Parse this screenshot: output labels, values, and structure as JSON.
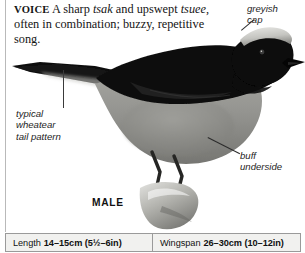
{
  "figure": {
    "species_caption": "MALE",
    "voice": {
      "label": "VOICE",
      "text_part1": " A sharp ",
      "italic1": "tsak",
      "text_part2": " and upswept ",
      "italic2": "tsuee",
      "text_part3": ", often in combination; buzzy, repetitive song."
    },
    "annotations": [
      {
        "id": "greyish-cap",
        "text": "greyish\ncap"
      },
      {
        "id": "tail-pattern",
        "text": "typical\nwheatear\ntail pattern"
      },
      {
        "id": "buff-underside",
        "text": "buff\nunderside"
      }
    ],
    "measurements": [
      {
        "key": "Length",
        "value": "14–15cm (5½–6in)"
      },
      {
        "key": "Wingspan",
        "value": "26–30cm (10–12in)"
      }
    ],
    "colors": {
      "page_background": "#ffffff",
      "rule": "#b9b9b9",
      "panel_background": "#f1f1ef",
      "panel_border": "#9a9a9a",
      "bird_upperparts": "#0d0d0d",
      "bird_cap": "#cfcfcb",
      "bird_underside": "#8e8e8a",
      "bird_legs": "#2a2a28",
      "perch_rock": "#bdbdb8",
      "text": "#141414"
    }
  }
}
